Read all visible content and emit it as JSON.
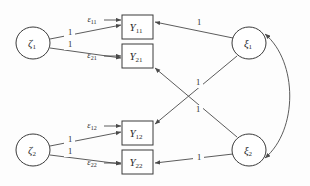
{
  "diagram": {
    "type": "path-diagram",
    "stroke_color": "#4a4a4a",
    "node_fill": "#ffffff",
    "background": "#fdfdfd",
    "latent_nodes": [
      {
        "id": "zeta1",
        "glyph": "ζ",
        "subscript": "1",
        "shape": "ellipse",
        "cx": 33,
        "cy": 43,
        "rx": 17,
        "ry": 16
      },
      {
        "id": "zeta2",
        "glyph": "ζ",
        "subscript": "2",
        "shape": "ellipse",
        "cx": 33,
        "cy": 150,
        "rx": 17,
        "ry": 16
      },
      {
        "id": "xi1",
        "glyph": "ξ",
        "subscript": "1",
        "shape": "ellipse",
        "cx": 249,
        "cy": 43,
        "rx": 17,
        "ry": 16
      },
      {
        "id": "xi2",
        "glyph": "ξ",
        "subscript": "2",
        "shape": "ellipse",
        "cx": 249,
        "cy": 150,
        "rx": 17,
        "ry": 16
      }
    ],
    "observed_nodes": [
      {
        "id": "Y11",
        "glyph": "Y",
        "subscript": "11",
        "shape": "rect",
        "x": 122,
        "y": 15,
        "w": 31,
        "h": 24
      },
      {
        "id": "Y21",
        "glyph": "Y",
        "subscript": "21",
        "shape": "rect",
        "x": 122,
        "y": 44,
        "w": 31,
        "h": 24
      },
      {
        "id": "Y12",
        "glyph": "Y",
        "subscript": "12",
        "shape": "rect",
        "x": 122,
        "y": 121,
        "w": 31,
        "h": 24
      },
      {
        "id": "Y22",
        "glyph": "Y",
        "subscript": "22",
        "shape": "rect",
        "x": 122,
        "y": 150,
        "w": 31,
        "h": 24
      }
    ],
    "error_terms": [
      {
        "id": "eps11",
        "glyph": "ε",
        "subscript": "11",
        "x": 92,
        "y": 20,
        "target": "Y11"
      },
      {
        "id": "eps21",
        "glyph": "ε",
        "subscript": "21",
        "x": 92,
        "y": 56,
        "target": "Y21"
      },
      {
        "id": "eps12",
        "glyph": "ε",
        "subscript": "12",
        "x": 92,
        "y": 126,
        "target": "Y12"
      },
      {
        "id": "eps22",
        "glyph": "ε",
        "subscript": "22",
        "x": 92,
        "y": 163,
        "target": "Y22"
      }
    ],
    "edges": [
      {
        "id": "zeta1-Y11",
        "from": "zeta1",
        "to": "Y11",
        "label": "1",
        "label_x": 70,
        "label_y": 33
      },
      {
        "id": "zeta1-Y21",
        "from": "zeta1",
        "to": "Y21",
        "label": "1",
        "label_x": 70,
        "label_y": 45
      },
      {
        "id": "zeta2-Y12",
        "from": "zeta2",
        "to": "Y12",
        "label": "1",
        "label_x": 70,
        "label_y": 140
      },
      {
        "id": "zeta2-Y22",
        "from": "zeta2",
        "to": "Y22",
        "label": "1",
        "label_x": 70,
        "label_y": 152
      },
      {
        "id": "xi1-Y11",
        "from": "xi1",
        "to": "Y11",
        "label": "1",
        "label_x": 199,
        "label_y": 23
      },
      {
        "id": "xi1-Y12",
        "from": "xi1",
        "to": "Y12",
        "label": "1",
        "label_x": 198,
        "label_y": 83
      },
      {
        "id": "xi2-Y21",
        "from": "xi2",
        "to": "Y21",
        "label": "1",
        "label_x": 198,
        "label_y": 110
      },
      {
        "id": "xi2-Y22",
        "from": "xi2",
        "to": "Y22",
        "label": "1",
        "label_x": 199,
        "label_y": 158
      },
      {
        "id": "eps11-Y11",
        "from": "eps11",
        "to": "Y11",
        "label": "",
        "label_x": 0,
        "label_y": 0
      },
      {
        "id": "eps21-Y21",
        "from": "eps21",
        "to": "Y21",
        "label": "",
        "label_x": 0,
        "label_y": 0
      },
      {
        "id": "eps12-Y12",
        "from": "eps12",
        "to": "Y12",
        "label": "",
        "label_x": 0,
        "label_y": 0
      },
      {
        "id": "eps22-Y22",
        "from": "eps22",
        "to": "Y22",
        "label": "",
        "label_x": 0,
        "label_y": 0
      }
    ],
    "covariance": {
      "id": "xi1-xi2-covariance",
      "from": "xi1",
      "to": "xi2",
      "style": "double-headed-curve",
      "label": ""
    }
  }
}
